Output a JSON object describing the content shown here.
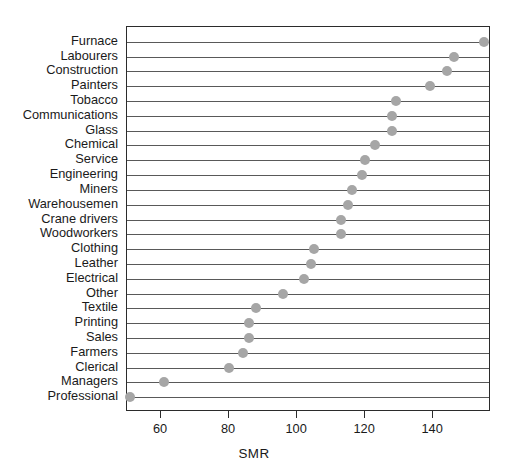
{
  "chart_data": {
    "type": "scatter",
    "subtype": "cleveland-dot-plot",
    "title": "",
    "xlabel": "SMR",
    "ylabel": "",
    "xlim": [
      50,
      157
    ],
    "xticks": [
      60,
      80,
      100,
      120,
      140
    ],
    "xticklabels": [
      "60",
      "80",
      "100",
      "120",
      "140"
    ],
    "grid": "horizontal-row-lines",
    "legend": "none",
    "orientation": "horizontal",
    "sorted": "descending",
    "categories": [
      "Furnace",
      "Labourers",
      "Construction",
      "Painters",
      "Tobacco",
      "Communications",
      "Glass",
      "Chemical",
      "Service",
      "Engineering",
      "Miners",
      "Warehousemen",
      "Crane drivers",
      "Woodworkers",
      "Clothing",
      "Leather",
      "Electrical",
      "Other",
      "Textile",
      "Printing",
      "Sales",
      "Farmers",
      "Clerical",
      "Managers",
      "Professional"
    ],
    "values": [
      155,
      146,
      144,
      139,
      129,
      128,
      128,
      123,
      120,
      119,
      116,
      115,
      113,
      113,
      105,
      104,
      102,
      96,
      88,
      86,
      86,
      84,
      80,
      61,
      51
    ],
    "point_color": "#a6a6a6",
    "line_color": "#595959",
    "axis_color": "#2b2b2b",
    "background_color": "#ffffff"
  }
}
